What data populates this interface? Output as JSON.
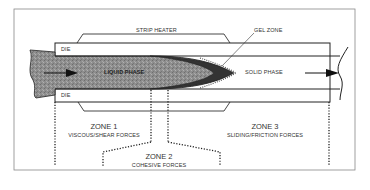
{
  "diagram": {
    "labels": {
      "strip_heater": "STRIP HEATER",
      "gel_zone": "GEL ZONE",
      "die_top": "DIE",
      "die_bottom": "DIE",
      "liquid_phase": "LIQUID PHASE",
      "solid_phase": "SOLID PHASE"
    },
    "zones": [
      {
        "title": "ZONE 1",
        "subtitle": "VISCOUS/SHEAR FORCES"
      },
      {
        "title": "ZONE 2",
        "subtitle": "COHESIVE FORCES"
      },
      {
        "title": "ZONE 3",
        "subtitle": "SLIDING/FRICTION FORCES"
      }
    ],
    "colors": {
      "line": "#2a2a2a",
      "liquid_fill": "#8c8c8c",
      "gel_fill": "#3a3a3a",
      "frame": "#777777"
    }
  }
}
